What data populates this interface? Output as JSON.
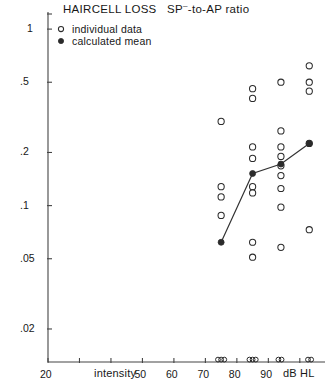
{
  "chart_data": {
    "type": "scatter",
    "title_main": "HAIRCELL LOSS   SP",
    "title_sup": "–",
    "title_rest": "-to-AP ratio",
    "xlabel": "intensity",
    "xunit": "dB HL",
    "ylabel": "",
    "xlim": [
      20,
      108
    ],
    "ylim": [
      0.013,
      1.25
    ],
    "yscale": "log",
    "grid": false,
    "legend_position": "top-left",
    "xticks": [
      20,
      30,
      40,
      50,
      60,
      70,
      80,
      90,
      100
    ],
    "xticklabels": [
      "20",
      "",
      "",
      "50",
      "60",
      "70",
      "80",
      "90",
      ""
    ],
    "yticks": [
      1,
      0.5,
      0.2,
      0.1,
      0.05,
      0.02
    ],
    "yticklabels": [
      "1",
      ".5",
      ".2",
      ".1",
      ".05",
      ".02"
    ],
    "legend": [
      {
        "marker": "open-circle",
        "label": "individual data"
      },
      {
        "marker": "filled-circle",
        "label": "calculated mean"
      }
    ],
    "series": [
      {
        "name": "individual data",
        "marker": "open-circle",
        "points": [
          {
            "x": 75,
            "y": 0.3
          },
          {
            "x": 75,
            "y": 0.128
          },
          {
            "x": 75,
            "y": 0.112
          },
          {
            "x": 75,
            "y": 0.088
          },
          {
            "x": 85,
            "y": 0.46
          },
          {
            "x": 85,
            "y": 0.405
          },
          {
            "x": 85,
            "y": 0.215
          },
          {
            "x": 85,
            "y": 0.185
          },
          {
            "x": 85,
            "y": 0.128
          },
          {
            "x": 85,
            "y": 0.118
          },
          {
            "x": 85,
            "y": 0.062
          },
          {
            "x": 85,
            "y": 0.051
          },
          {
            "x": 94,
            "y": 0.5
          },
          {
            "x": 94,
            "y": 0.265
          },
          {
            "x": 94,
            "y": 0.215
          },
          {
            "x": 94,
            "y": 0.19
          },
          {
            "x": 94,
            "y": 0.168
          },
          {
            "x": 94,
            "y": 0.148
          },
          {
            "x": 94,
            "y": 0.125
          },
          {
            "x": 94,
            "y": 0.098
          },
          {
            "x": 94,
            "y": 0.058
          },
          {
            "x": 103,
            "y": 0.62
          },
          {
            "x": 103,
            "y": 0.5
          },
          {
            "x": 103,
            "y": 0.445
          },
          {
            "x": 103,
            "y": 0.225
          },
          {
            "x": 103,
            "y": 0.073
          }
        ]
      },
      {
        "name": "calculated mean",
        "marker": "filled-circle",
        "line": true,
        "points": [
          {
            "x": 75,
            "y": 0.062
          },
          {
            "x": 85,
            "y": 0.152
          },
          {
            "x": 94,
            "y": 0.172
          },
          {
            "x": 103,
            "y": 0.225
          }
        ]
      },
      {
        "name": "below-scale data",
        "marker": "small-open-circle",
        "on_axis": true,
        "points": [
          {
            "x": 74.0
          },
          {
            "x": 75.0
          },
          {
            "x": 76.0
          },
          {
            "x": 84.0
          },
          {
            "x": 85.0
          },
          {
            "x": 86.0
          },
          {
            "x": 93.2
          },
          {
            "x": 94.2
          },
          {
            "x": 102.6
          },
          {
            "x": 103.6
          }
        ]
      }
    ]
  },
  "colors": {
    "axis": "#444444",
    "marker": "#2b2b2b",
    "line": "#333333",
    "text": "#171717",
    "background": "#ffffff"
  }
}
